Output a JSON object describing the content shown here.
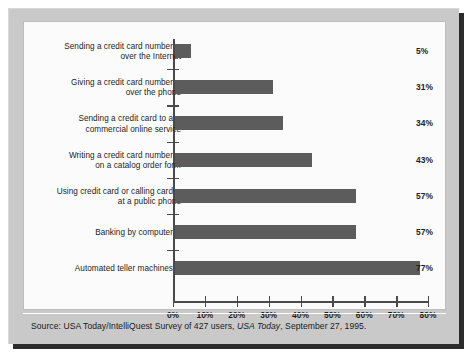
{
  "figure": {
    "source_prefix": "Source: USA Today/IntelliQuest Survey of 427 users, ",
    "source_italic": "USA Today",
    "source_suffix": ", September 27, 1995."
  },
  "chart_data": {
    "type": "bar",
    "orientation": "horizontal",
    "title": "",
    "subtitle": "",
    "xlabel": "",
    "ylabel": "",
    "xlim": [
      0,
      80
    ],
    "grid": false,
    "legend": null,
    "bar_color": "#5c5c5c",
    "value_suffix": "%",
    "categories": [
      "Sending a credit card number over the Internet",
      "Giving a credit card number over the phone",
      "Sending a credit card to a commercial online service",
      "Writing a credit card number on a catalog order form",
      "Using credit card or calling card at a public phone",
      "Banking by computer",
      "Automated teller machines"
    ],
    "category_lines": [
      [
        "Sending a credit card number",
        "over the Internet"
      ],
      [
        "Giving a credit card number",
        "over the phone"
      ],
      [
        "Sending a credit card to a",
        "commercial online service"
      ],
      [
        "Writing a credit card number",
        "on a catalog order form"
      ],
      [
        "Using credit card or calling card",
        "at a public phone"
      ],
      [
        "Banking by computer"
      ],
      [
        "Automated teller machines"
      ]
    ],
    "values": [
      5,
      31,
      34,
      43,
      57,
      57,
      77
    ],
    "value_labels": [
      "5%",
      "31%",
      "34%",
      "43%",
      "57%",
      "57%",
      "77%"
    ],
    "xticks": [
      0,
      10,
      20,
      30,
      40,
      50,
      60,
      70,
      80
    ],
    "xtick_labels": [
      "0%",
      "10%",
      "20%",
      "30%",
      "40%",
      "50%",
      "60%",
      "70%",
      "80%"
    ]
  }
}
